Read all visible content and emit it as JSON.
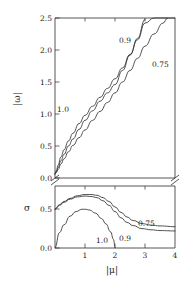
{
  "figure": {
    "xlabel": "|μ|",
    "panels": [
      {
        "name": "omega-panel",
        "ylabel": "|ω|",
        "yticks": [
          "0.0",
          "0.5",
          "1.0",
          "1.5",
          "2.0",
          "2.5"
        ],
        "curve_labels": [
          "1.0",
          "0.9",
          "0.75"
        ]
      },
      {
        "name": "sigma-panel",
        "ylabel": "σ",
        "yticks": [
          "0.0",
          "0.5"
        ],
        "curve_labels": [
          "1.0",
          "0.9",
          "0.75"
        ]
      }
    ],
    "xticks": [
      "1",
      "2",
      "3",
      "4"
    ]
  },
  "chart_data": {
    "type": "line",
    "title": "",
    "xlabel": "|μ|",
    "xlim": [
      0,
      4
    ],
    "xticks": [
      1,
      2,
      3,
      4
    ],
    "grid": false,
    "legend": "inline-curve-labels",
    "axis_break": true,
    "panels": [
      {
        "id": "upper",
        "ylabel": "|ω|",
        "ylim": [
          0,
          2.5
        ],
        "yticks": [
          0.0,
          0.5,
          1.0,
          1.5,
          2.0,
          2.5
        ],
        "series": [
          {
            "name": "1.0",
            "label": "1.0",
            "x": [
              0.0,
              0.05,
              0.1,
              0.2,
              0.3,
              0.45,
              0.6,
              0.8,
              1.0,
              1.25,
              1.5,
              1.75,
              2.0,
              2.25,
              2.5,
              2.75,
              3.0,
              3.3,
              3.6,
              4.0
            ],
            "y": [
              0.06,
              0.12,
              0.2,
              0.33,
              0.44,
              0.58,
              0.7,
              0.85,
              0.98,
              1.12,
              1.26,
              1.4,
              1.55,
              1.72,
              1.93,
              2.16,
              2.42,
              2.5,
              2.5,
              2.5
            ]
          },
          {
            "name": "0.9",
            "label": "0.9",
            "x": [
              0.0,
              0.05,
              0.1,
              0.2,
              0.3,
              0.45,
              0.6,
              0.8,
              1.0,
              1.25,
              1.5,
              1.75,
              2.0,
              2.25,
              2.5,
              2.75,
              3.0
            ],
            "y": [
              0.06,
              0.1,
              0.16,
              0.27,
              0.37,
              0.5,
              0.61,
              0.76,
              0.9,
              1.05,
              1.2,
              1.33,
              1.46,
              1.68,
              1.92,
              2.18,
              2.48
            ]
          },
          {
            "name": "0.75",
            "label": "0.75",
            "x": [
              0.0,
              0.05,
              0.1,
              0.2,
              0.3,
              0.45,
              0.6,
              0.8,
              1.0,
              1.25,
              1.5,
              1.75,
              2.0,
              2.25,
              2.5,
              2.75,
              3.0,
              3.3,
              3.6,
              3.75
            ],
            "y": [
              0.06,
              0.09,
              0.13,
              0.22,
              0.3,
              0.41,
              0.51,
              0.63,
              0.75,
              0.9,
              1.04,
              1.18,
              1.33,
              1.5,
              1.68,
              1.87,
              2.06,
              2.25,
              2.42,
              2.5
            ]
          }
        ]
      },
      {
        "id": "lower",
        "ylabel": "σ",
        "ylim": [
          0,
          0.8
        ],
        "yticks": [
          0.0,
          0.5
        ],
        "series": [
          {
            "name": "1.0",
            "label": "1.0",
            "x": [
              0.0,
              0.15,
              0.3,
              0.5,
              0.7,
              0.9,
              1.0,
              1.15,
              1.35,
              1.55,
              1.7,
              1.85,
              1.95,
              2.0
            ],
            "y": [
              0.0,
              0.2,
              0.3,
              0.41,
              0.47,
              0.5,
              0.5,
              0.49,
              0.45,
              0.38,
              0.31,
              0.21,
              0.11,
              0.0
            ]
          },
          {
            "name": "0.9",
            "label": "0.9",
            "x": [
              0.0,
              0.15,
              0.3,
              0.5,
              0.75,
              1.0,
              1.2,
              1.4,
              1.6,
              1.8,
              2.0,
              2.2,
              2.4,
              2.6,
              2.9,
              3.2,
              3.5,
              4.0
            ],
            "y": [
              0.5,
              0.55,
              0.59,
              0.63,
              0.66,
              0.67,
              0.665,
              0.65,
              0.61,
              0.55,
              0.47,
              0.39,
              0.33,
              0.29,
              0.25,
              0.235,
              0.225,
              0.22
            ]
          },
          {
            "name": "0.75",
            "label": "0.75",
            "x": [
              0.0,
              0.15,
              0.3,
              0.5,
              0.75,
              1.0,
              1.2,
              1.4,
              1.6,
              1.8,
              2.0,
              2.2,
              2.4,
              2.6,
              2.9,
              3.2,
              3.5,
              4.0
            ],
            "y": [
              0.5,
              0.56,
              0.6,
              0.64,
              0.675,
              0.69,
              0.69,
              0.68,
              0.65,
              0.6,
              0.53,
              0.46,
              0.4,
              0.355,
              0.315,
              0.295,
              0.285,
              0.275
            ]
          }
        ]
      }
    ]
  }
}
